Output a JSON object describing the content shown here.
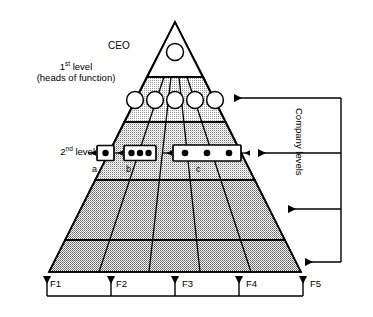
{
  "figure": {
    "type": "pyramid-organization-diagram",
    "title_visible": false,
    "colors": {
      "stroke": "#000000",
      "apex_fill": "#ffffff",
      "band_level1_fill": "#dcdcdc",
      "band_level2_fill": "#c8c8c8",
      "band_level3_fill": "#b4b4b4",
      "band_level4_fill": "#b0b0b0",
      "node_fill": "#ffffff",
      "dot_fill": "#000000",
      "background": "#ffffff"
    }
  },
  "labels": {
    "ceo": "CEO",
    "level1_line1": "1",
    "level1_line1_sup": "st",
    "level1_line1_rest": " level",
    "level1_line2": "(heads of function)",
    "level2": "2",
    "level2_sup": "nd",
    "level2_rest": " level",
    "group_a": "a",
    "group_b": "b",
    "group_c": "c",
    "company_levels": "Company levels"
  },
  "functions": {
    "axis_name": "Functions",
    "items": [
      {
        "id": "F1",
        "label": "F1"
      },
      {
        "id": "F2",
        "label": "F2"
      },
      {
        "id": "F3",
        "label": "F3"
      },
      {
        "id": "F4",
        "label": "F4"
      },
      {
        "id": "F5",
        "label": "F5"
      }
    ]
  },
  "pyramid": {
    "apex": {
      "node_count": 1,
      "shape": "circle",
      "filled": false
    },
    "bands": [
      {
        "index": 1,
        "name": "1st level (heads of function)",
        "node_count": 5,
        "shape": "circle",
        "filled": false,
        "shade": "light"
      },
      {
        "index": 2,
        "name": "2nd level",
        "node_count": 0,
        "shade": "medium-light"
      },
      {
        "index": 3,
        "name": "level 3",
        "node_count": 0,
        "shade": "medium"
      },
      {
        "index": 4,
        "name": "level 4",
        "node_count": 0,
        "shade": "dark"
      }
    ],
    "teams": [
      {
        "id": "a",
        "label": "a",
        "member_count": 1,
        "spans_functions": [
          "F1"
        ]
      },
      {
        "id": "b",
        "label": "b",
        "member_count": 3,
        "spans_functions": [
          "F2"
        ]
      },
      {
        "id": "c",
        "label": "c",
        "member_count": 3,
        "spans_functions": [
          "F3",
          "F4"
        ]
      }
    ]
  },
  "annotations": {
    "company_level_arrow_count": 4,
    "function_arrow_count": 5,
    "company_levels_bracket": "right-side vertical bracket with 4 leftward arrows",
    "functions_bracket": "bottom horizontal bracket with 5 upward arrows"
  },
  "caption": {
    "partial_text": ""
  }
}
